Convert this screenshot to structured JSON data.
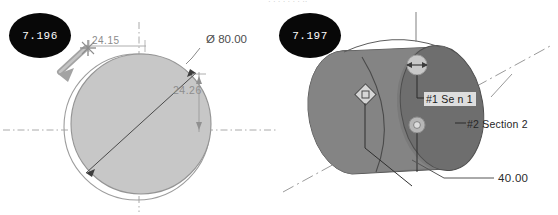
{
  "document": {
    "type": "cad-drawing-figure-pair",
    "background_color": "#ffffff",
    "width": 558,
    "height": 215
  },
  "figures": [
    {
      "badge": "7.196",
      "view": "front-circle-view",
      "annotations": [
        {
          "name": "diameter",
          "text": "Ø 80.00"
        },
        {
          "name": "dim-2415",
          "text": "24.15"
        },
        {
          "name": "dim-2426",
          "text": "24.26"
        }
      ],
      "colors": {
        "fill": "#c6c6c6",
        "outline": "#8f8f8f",
        "centerline": "#9a9a9a",
        "dimension": "#555555",
        "arrow": "#8c8c8c"
      }
    },
    {
      "badge": "7.197",
      "view": "isometric-cylinder-view",
      "annotations": [
        {
          "name": "section-1-callout",
          "text": "#1 Se     n 1"
        },
        {
          "name": "section-2-callout",
          "text": "#2 Section 2"
        },
        {
          "name": "dim-40",
          "text": "40.00"
        }
      ],
      "colors": {
        "face_light": "#9a9a9a",
        "body_dark": "#6d6d6d",
        "body_mid": "#848484",
        "edge": "#4f4f4f",
        "axis": "#8c8c8c",
        "marker": "#bdbdbd"
      }
    }
  ],
  "overflow": {
    "top_clipped_text": "·  ·       ·  ·        ·      ·   · ··"
  },
  "badges": {
    "left": "7.196",
    "right": "7.197",
    "bg": "#080808",
    "fg": "#ffffff"
  }
}
